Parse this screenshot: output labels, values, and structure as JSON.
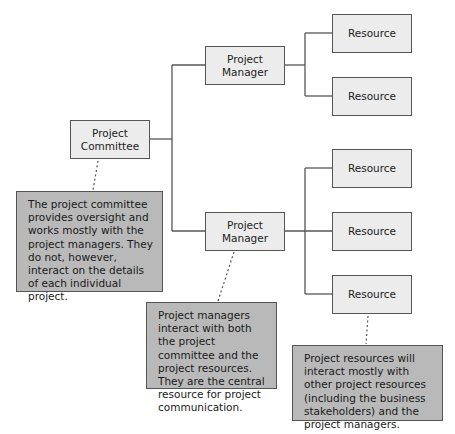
{
  "diagram": {
    "type": "org-chart",
    "nodes": {
      "committee": {
        "label_line1": "Project",
        "label_line2": "Committee"
      },
      "manager_top": {
        "label_line1": "Project",
        "label_line2": "Manager"
      },
      "manager_bottom": {
        "label_line1": "Project",
        "label_line2": "Manager"
      },
      "resources": [
        "Resource",
        "Resource",
        "Resource",
        "Resource",
        "Resource"
      ]
    },
    "notes": {
      "committee_note": "The project committee provides oversight and works mostly with the project managers. They do not, however, interact on the details of each individual project.",
      "manager_note": "Project managers interact with both the project committee and the project resources. They are the central resource for project communication.",
      "resource_note": "Project resources will interact mostly with other project resources (including the business stakeholders) and the project managers."
    },
    "colors": {
      "node_fill": "#ececec",
      "note_fill": "#b9b9b9",
      "line": "#555555"
    }
  }
}
